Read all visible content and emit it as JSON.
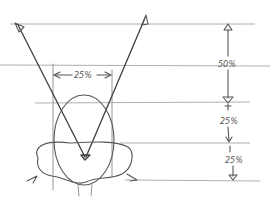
{
  "diagram": {
    "type": "pencil proportion sketch",
    "labels": {
      "width_label": "25%",
      "top_section": "50%",
      "middle_section": "25%",
      "bottom_section": "25%"
    },
    "colors": {
      "background": "#ffffff",
      "pencil": "#555555",
      "guide": "#9a9a9a"
    }
  }
}
